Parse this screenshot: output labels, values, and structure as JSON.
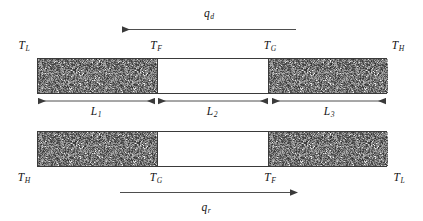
{
  "figure": {
    "background_color": "#ffffff",
    "line_color": "#3a3a3a",
    "hatch_color": "#9b9b9b",
    "text_color": "#141414"
  },
  "top_assembly": {
    "heat_flux_label": {
      "symbol": "q",
      "subscript": "d",
      "text": "qd"
    },
    "heat_flux_direction": "left",
    "temperatures": [
      {
        "id": "top-left",
        "symbol": "T",
        "subscript": "L",
        "text": "TL"
      },
      {
        "id": "top-mid-1",
        "symbol": "T",
        "subscript": "F",
        "text": "TF"
      },
      {
        "id": "top-mid-2",
        "symbol": "T",
        "subscript": "G",
        "text": "TG"
      },
      {
        "id": "top-right",
        "symbol": "T",
        "subscript": "H",
        "text": "TH"
      }
    ],
    "segments": [
      {
        "id": "segment-1",
        "material": "hatched"
      },
      {
        "id": "segment-2",
        "material": "blank"
      },
      {
        "id": "segment-3",
        "material": "hatched"
      }
    ]
  },
  "dimensions": [
    {
      "id": "length-1",
      "symbol": "L",
      "subscript": "1",
      "text": "L1"
    },
    {
      "id": "length-2",
      "symbol": "L",
      "subscript": "2",
      "text": "L2"
    },
    {
      "id": "length-3",
      "symbol": "L",
      "subscript": "3",
      "text": "L3"
    }
  ],
  "bottom_assembly": {
    "heat_flux_label": {
      "symbol": "q",
      "subscript": "r",
      "text": "qr"
    },
    "heat_flux_direction": "right",
    "temperatures": [
      {
        "id": "bottom-left",
        "symbol": "T",
        "subscript": "H",
        "text": "TH"
      },
      {
        "id": "bottom-mid-1",
        "symbol": "T",
        "subscript": "G",
        "text": "TG"
      },
      {
        "id": "bottom-mid-2",
        "symbol": "T",
        "subscript": "F",
        "text": "TF"
      },
      {
        "id": "bottom-right",
        "symbol": "T",
        "subscript": "L",
        "text": "TL"
      }
    ],
    "segments": [
      {
        "id": "segment-1",
        "material": "hatched"
      },
      {
        "id": "segment-2",
        "material": "blank"
      },
      {
        "id": "segment-3",
        "material": "hatched"
      }
    ]
  }
}
